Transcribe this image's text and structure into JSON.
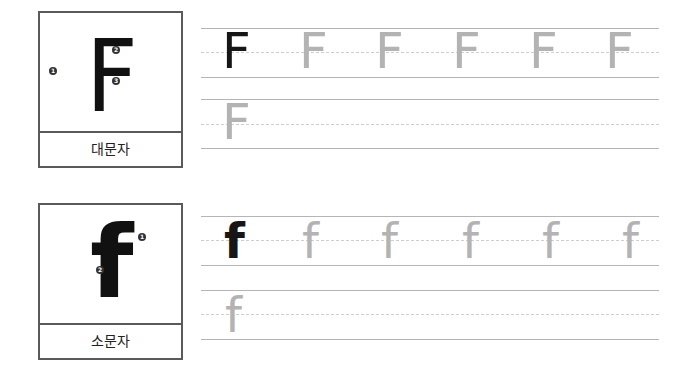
{
  "uppercase": {
    "letter": "F",
    "label": "대문자",
    "stroke_numbers": [
      "1",
      "2",
      "3"
    ],
    "trace_letter": "F",
    "row1_count_light": 5,
    "row2_letter": "F"
  },
  "lowercase": {
    "letter": "f",
    "label": "소문자",
    "stroke_numbers": [
      "1",
      "2"
    ],
    "trace_letter": "f",
    "row2_letter": "f"
  },
  "colors": {
    "model_letter": "#161616",
    "trace_letter": "#b3b3b3",
    "box_border": "#5a5a5a",
    "line_solid": "#b5b5b5",
    "line_dashed": "#cfcfcf"
  }
}
